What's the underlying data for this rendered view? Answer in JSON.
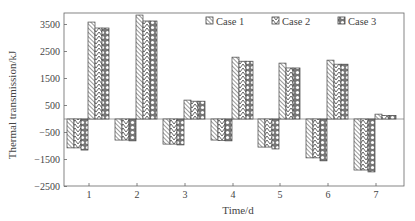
{
  "chart_data": {
    "type": "bar",
    "title": "",
    "xlabel": "Time/d",
    "ylabel": "Thermal transmission/kJ",
    "categories": [
      "1",
      "2",
      "3",
      "4",
      "5",
      "6",
      "7"
    ],
    "ylim": [
      -2500,
      4000
    ],
    "yticks": [
      3500,
      2500,
      1500,
      500,
      -500,
      -1500,
      -2500
    ],
    "grid": false,
    "legend_position": "top-right inside",
    "series": [
      {
        "name": "Case 1",
        "pattern": "diagonal-backslash",
        "gain": [
          3590,
          3850,
          700,
          2290,
          2070,
          2180,
          180
        ],
        "loss": [
          -1070,
          -780,
          -930,
          -780,
          -1040,
          -1440,
          -1890
        ]
      },
      {
        "name": "Case 2",
        "pattern": "herringbone",
        "gain": [
          3370,
          3630,
          660,
          2140,
          1890,
          2030,
          130
        ],
        "loss": [
          -1070,
          -780,
          -930,
          -800,
          -1040,
          -1440,
          -1890
        ]
      },
      {
        "name": "Case 3",
        "pattern": "circles",
        "gain": [
          3370,
          3630,
          660,
          2140,
          1890,
          2030,
          130
        ],
        "loss": [
          -1150,
          -810,
          -960,
          -810,
          -1110,
          -1550,
          -1960
        ]
      }
    ]
  },
  "legend": {
    "items": [
      "Case 1",
      "Case 2",
      "Case 3"
    ]
  },
  "axes": {
    "xlabel": "Time/d",
    "ylabel": "Thermal transmission/kJ"
  },
  "colors": {
    "stroke": "#444444",
    "background": "#ffffff"
  }
}
